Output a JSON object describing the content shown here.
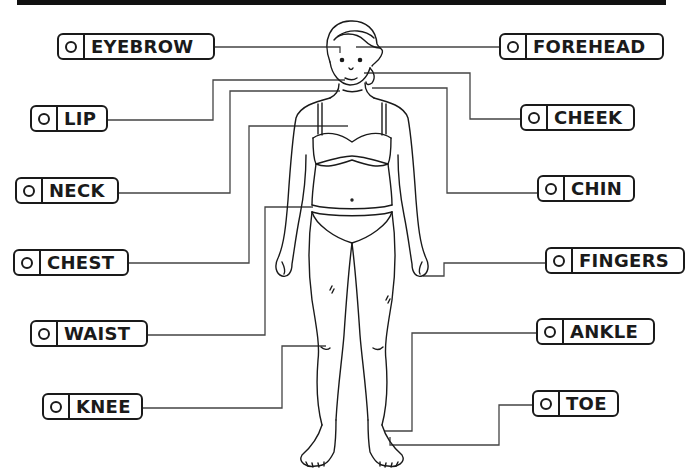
{
  "diagram": {
    "title_bar_color": "#111111",
    "line_color": "#444444",
    "figure": "female-body-front-view-line-art",
    "labels_left": [
      {
        "id": "eyebrow",
        "text": "EYEBROW",
        "selected": false
      },
      {
        "id": "lip",
        "text": "LIP",
        "selected": false
      },
      {
        "id": "neck",
        "text": "NECK",
        "selected": false
      },
      {
        "id": "chest",
        "text": "CHEST",
        "selected": false
      },
      {
        "id": "waist",
        "text": "WAIST",
        "selected": false
      },
      {
        "id": "knee",
        "text": "KNEE",
        "selected": false
      }
    ],
    "labels_right": [
      {
        "id": "forehead",
        "text": "FOREHEAD",
        "selected": false
      },
      {
        "id": "cheek",
        "text": "CHEEK",
        "selected": false
      },
      {
        "id": "chin",
        "text": "CHIN",
        "selected": false
      },
      {
        "id": "fingers",
        "text": "FINGERS",
        "selected": false
      },
      {
        "id": "ankle",
        "text": "ANKLE",
        "selected": false
      },
      {
        "id": "toe",
        "text": "TOE",
        "selected": false
      }
    ]
  }
}
